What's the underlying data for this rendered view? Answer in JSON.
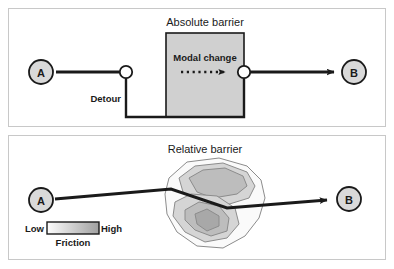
{
  "figure": {
    "panels": [
      {
        "id": "absolute",
        "title": "Absolute barrier",
        "origin_label": "A",
        "destination_label": "B",
        "barrier_label": "Modal change",
        "detour_label": "Detour"
      },
      {
        "id": "relative",
        "title": "Relative barrier",
        "origin_label": "A",
        "destination_label": "B",
        "legend": {
          "low_label": "Low",
          "high_label": "High",
          "caption": "Friction"
        }
      }
    ]
  },
  "colors": {
    "panel_border": "#c8c8c8",
    "line": "#1a1a1a",
    "node_fill": "#d9d9d9",
    "barrier_fill": "#d0d0d0",
    "barrier_stroke": "#1a1a1a",
    "contour_outer": "#fafafa",
    "contour_mid": "#d5d5d5",
    "contour_inner": "#bdbdbd",
    "contour_core": "#a8a8a8",
    "contour_stroke": "#8c8c8c",
    "gradient_low": "#fdfdfd",
    "gradient_high": "#a0a0a0"
  }
}
